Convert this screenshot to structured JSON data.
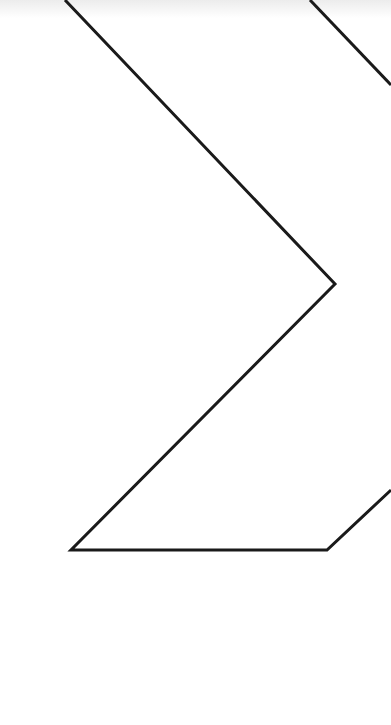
{
  "diagram": {
    "stroke_color": "#1a1a1a",
    "background_color": "#ffffff",
    "stroke_width": 3,
    "paths": [
      {
        "name": "main-zigzag",
        "points": [
          [
            65,
            0
          ],
          [
            335,
            284
          ],
          [
            71,
            550
          ],
          [
            327,
            550
          ],
          [
            391,
            490
          ]
        ]
      },
      {
        "name": "upper-right-segment",
        "points": [
          [
            310,
            0
          ],
          [
            391,
            85
          ]
        ]
      }
    ]
  }
}
